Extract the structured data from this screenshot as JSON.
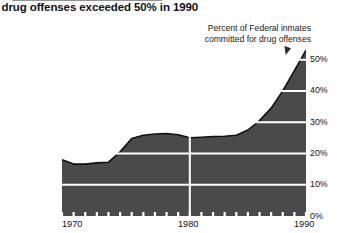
{
  "title": "r drug offenses exceeded 50% in 1990",
  "legend": {
    "line1": "Percent of Federal inmates",
    "line2": "committed for drug offenses"
  },
  "colors": {
    "area_fill": "#4a4a4a",
    "area_outline": "#101010",
    "gridline": "#ffffff",
    "text": "#111111",
    "background": "#ffffff"
  },
  "chart_data": {
    "type": "area",
    "title": "r drug offenses exceeded 50% in 1990",
    "xlabel": "",
    "ylabel": "Percent of Federal inmates committed for drug offenses",
    "xlim": [
      1969,
      1990
    ],
    "ylim": [
      0,
      55
    ],
    "grid": true,
    "gridlines_y": [
      10,
      20,
      30,
      40,
      50
    ],
    "gridlines_x": [
      1980
    ],
    "legend_position": "top-right",
    "y_tick_labels": [
      "0%",
      "10%",
      "20%",
      "30%",
      "40%",
      "50%"
    ],
    "y_tick_values": [
      0,
      10,
      20,
      30,
      40,
      50
    ],
    "x_tick_labels": [
      "1970",
      "1980",
      "1990"
    ],
    "x_tick_values": [
      1970,
      1980,
      1990
    ],
    "x_minor_ticks_every": 1,
    "series": [
      {
        "name": "Percent of Federal inmates committed for drug offenses",
        "x": [
          1969,
          1970,
          1971,
          1972,
          1973,
          1974,
          1975,
          1976,
          1977,
          1978,
          1979,
          1980,
          1981,
          1982,
          1983,
          1984,
          1985,
          1986,
          1987,
          1988,
          1989,
          1990
        ],
        "values": [
          18.0,
          16.6,
          16.6,
          17.0,
          17.2,
          20.5,
          24.8,
          25.8,
          26.2,
          26.4,
          26.0,
          25.0,
          25.2,
          25.4,
          25.5,
          25.8,
          27.5,
          30.5,
          34.5,
          40.0,
          46.5,
          53.0
        ]
      }
    ],
    "y_axis_side": "right"
  },
  "xaxis": {
    "t1970": "1970",
    "t1980": "1980",
    "t1990": "1990"
  },
  "yaxis": {
    "t0": "0%",
    "t10": "10%",
    "t20": "20%",
    "t30": "30%",
    "t40": "40%",
    "t50": "50%"
  }
}
